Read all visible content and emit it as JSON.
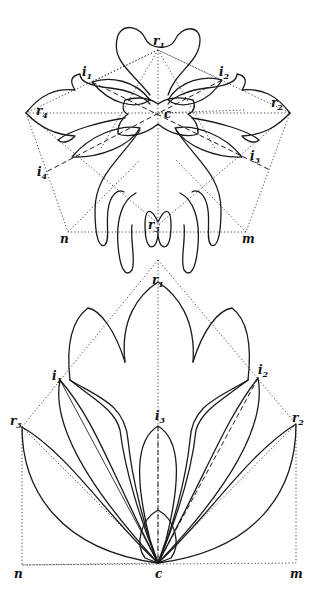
{
  "figure_top": {
    "labels": {
      "r1": {
        "base": "r",
        "sub": "1",
        "x": 153,
        "y": 45
      },
      "i1": {
        "base": "i",
        "sub": "1",
        "x": 82,
        "y": 76
      },
      "i2": {
        "base": "i",
        "sub": "2",
        "x": 219,
        "y": 76
      },
      "r4": {
        "base": "r",
        "sub": "4",
        "x": 36,
        "y": 115
      },
      "r2": {
        "base": "r",
        "sub": "2",
        "x": 271,
        "y": 107
      },
      "c": {
        "base": "c",
        "sub": "",
        "x": 164,
        "y": 118
      },
      "i3": {
        "base": "i",
        "sub": "3",
        "x": 250,
        "y": 160
      },
      "i4": {
        "base": "i",
        "sub": "4",
        "x": 37,
        "y": 176
      },
      "r3": {
        "base": "r",
        "sub": "3",
        "x": 148,
        "y": 229
      },
      "n": {
        "base": "n",
        "sub": "",
        "x": 60,
        "y": 243
      },
      "m": {
        "base": "m",
        "sub": "",
        "x": 242,
        "y": 243
      }
    }
  },
  "figure_bottom": {
    "labels": {
      "r1": {
        "base": "r",
        "sub": "1",
        "x": 152,
        "y": 284
      },
      "i1": {
        "base": "i",
        "sub": "1",
        "x": 52,
        "y": 380
      },
      "i2": {
        "base": "i",
        "sub": "2",
        "x": 258,
        "y": 374
      },
      "i3": {
        "base": "i",
        "sub": "3",
        "x": 155,
        "y": 420
      },
      "r3": {
        "base": "r",
        "sub": "3",
        "x": 10,
        "y": 425
      },
      "r2": {
        "base": "r",
        "sub": "2",
        "x": 292,
        "y": 422
      },
      "n": {
        "base": "n",
        "sub": "",
        "x": 14,
        "y": 575
      },
      "c": {
        "base": "c",
        "sub": "",
        "x": 155,
        "y": 575
      },
      "m": {
        "base": "m",
        "sub": "",
        "x": 290,
        "y": 575
      }
    }
  }
}
